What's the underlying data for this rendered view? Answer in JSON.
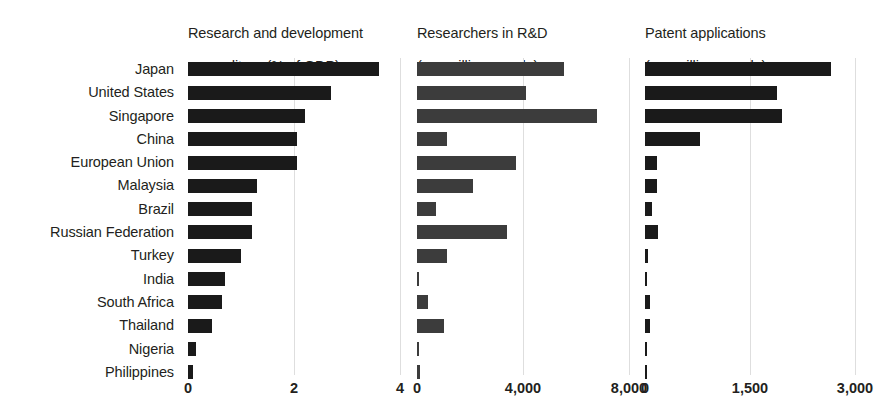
{
  "chart_data": {
    "type": "bar",
    "orientation": "horizontal",
    "title": "",
    "grid": true,
    "legend": null,
    "categories": [
      "Japan",
      "United States",
      "Singapore",
      "China",
      "European Union",
      "Malaysia",
      "Brazil",
      "Russian Federation",
      "Turkey",
      "India",
      "South Africa",
      "Thailand",
      "Nigeria",
      "Philippines"
    ],
    "panels": [
      {
        "id": "rd-expenditure",
        "title": "Research and development\nexpenditure (% of GDP)",
        "title_line1": "Research and development",
        "title_line2": "expenditure (% of GDP)",
        "xlabel": "",
        "ylabel": "",
        "xlim": [
          0,
          4
        ],
        "ticks": [
          0,
          2,
          4
        ],
        "tick_labels": [
          "0",
          "2",
          "4"
        ],
        "bar_color": "#1a1a1a",
        "values": [
          3.6,
          2.7,
          2.2,
          2.05,
          2.05,
          1.3,
          1.2,
          1.2,
          1.0,
          0.7,
          0.65,
          0.45,
          0.15,
          0.1
        ]
      },
      {
        "id": "researchers-in-rd",
        "title": "Researchers in R&D\n(per million people)",
        "title_line1": "Researchers in R&D",
        "title_line2": "(per million people)",
        "xlabel": "",
        "ylabel": "",
        "xlim": [
          0,
          8000
        ],
        "ticks": [
          0,
          4000,
          8000
        ],
        "tick_labels": [
          "0",
          "4,000",
          "8,000"
        ],
        "bar_color": "#3c3c3c",
        "values": [
          5550,
          4120,
          6800,
          1150,
          3750,
          2100,
          700,
          3400,
          1150,
          90,
          400,
          1000,
          40,
          110
        ]
      },
      {
        "id": "patent-applications",
        "title": "Patent applications\n(per million people)",
        "title_line1": "Patent applications",
        "title_line2": "(per million people)",
        "xlabel": "",
        "ylabel": "",
        "xlim": [
          0,
          3000
        ],
        "ticks": [
          0,
          1500,
          3000
        ],
        "tick_labels": [
          "0",
          "1,500",
          "3,000"
        ],
        "bar_color": "#1a1a1a",
        "values": [
          2650,
          1880,
          1950,
          780,
          170,
          170,
          100,
          180,
          40,
          20,
          70,
          70,
          6,
          12
        ]
      }
    ]
  },
  "layout": {
    "label_column_width": 181,
    "panels_px": [
      {
        "left": 188,
        "width": 212,
        "zero_px": 0,
        "unit_px": 49.75
      },
      {
        "left": 417,
        "width": 212,
        "zero_px": 0,
        "unit_px": 0.0245
      },
      {
        "left": 645,
        "width": 210,
        "zero_px": 0,
        "unit_px": 0.06333
      }
    ]
  }
}
